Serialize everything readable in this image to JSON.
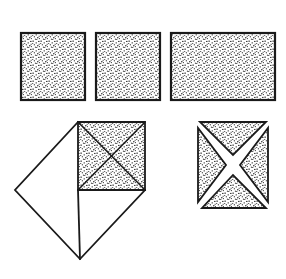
{
  "canvas": {
    "width": 286,
    "height": 279,
    "background_color": "#ffffff",
    "stroke_color": "#1a1a1a",
    "fill_style": "stipple-texture",
    "stipple_dot_color": "#2b2b2b"
  },
  "shapes": {
    "top_row": {
      "label": "top-row-rectangles",
      "count": 3,
      "common_top_y": 33,
      "common_bottom_y": 100,
      "items": [
        {
          "name": "square-one",
          "kind": "square",
          "x": 21,
          "y": 33,
          "width": 64,
          "height": 67,
          "fill": "stipple",
          "stroke": "#1a1a1a"
        },
        {
          "name": "square-two",
          "kind": "square",
          "x": 96,
          "y": 33,
          "width": 64,
          "height": 67,
          "fill": "stipple",
          "stroke": "#1a1a1a"
        },
        {
          "name": "rectangle-three",
          "kind": "rectangle",
          "x": 171,
          "y": 33,
          "width": 104,
          "height": 67,
          "fill": "stipple",
          "stroke": "#1a1a1a"
        }
      ]
    },
    "fold_diagram": {
      "name": "folded-diamond-figure",
      "diamond": {
        "name": "diamond-outline",
        "fill": "white",
        "points": "78,122 145,190 80,259 15,190"
      },
      "stippled_square": {
        "name": "stippled-quadrant-square",
        "fill": "stipple",
        "points": "78,122 145,122 145,190 78,190"
      },
      "diagonals": [
        {
          "name": "diagonal-tl-br",
          "x1": 78,
          "y1": 122,
          "x2": 145,
          "y2": 190
        },
        {
          "name": "diagonal-tr-bl",
          "x1": 145,
          "y1": 122,
          "x2": 78,
          "y2": 190
        }
      ],
      "fold_line": {
        "name": "vertical-fold-line",
        "x1": 78,
        "y1": 190,
        "x2": 80,
        "y2": 259
      },
      "base_line": {
        "name": "horizontal-base-line",
        "x1": 78,
        "y1": 190,
        "x2": 145,
        "y2": 190
      }
    },
    "exploded_square": {
      "name": "exploded-four-triangle-square",
      "bounds": {
        "x": 198,
        "y": 122,
        "width": 70,
        "height": 86
      },
      "center": {
        "x": 233,
        "y": 165
      },
      "gap": "white X-shaped separation between the four triangles",
      "triangles": [
        {
          "name": "triangle-top",
          "fill": "stipple",
          "points": "200,122 266,122 233,155"
        },
        {
          "name": "triangle-right",
          "fill": "stipple",
          "points": "268,128 268,202 240,165"
        },
        {
          "name": "triangle-bottom",
          "fill": "stipple",
          "points": "202,208 266,208 233,175"
        },
        {
          "name": "triangle-left",
          "fill": "stipple",
          "points": "198,128 198,202 226,165"
        }
      ]
    }
  }
}
